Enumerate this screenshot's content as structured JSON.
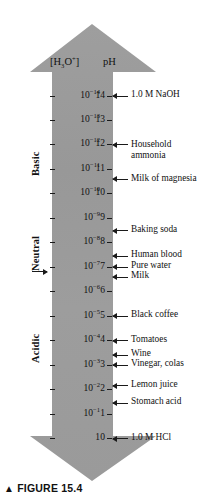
{
  "figure": {
    "caption_marker": "▲",
    "caption": "FIGURE 15.4",
    "arrow_color": "#9a9a9a",
    "text_color": "#111111"
  },
  "headers": {
    "concentration": "[H3O+]",
    "concentration_base": "[H",
    "concentration_sub": "3",
    "concentration_mid": "O",
    "concentration_sup": "+",
    "concentration_end": "]",
    "ph": "pH"
  },
  "regions": [
    {
      "label": "Basic",
      "top_ph": 14,
      "bottom_ph": 7.6
    },
    {
      "label": "Neutral",
      "top_ph": 7.6,
      "bottom_ph": 6.4
    },
    {
      "label": "Acidic",
      "top_ph": 6.4,
      "bottom_ph": 0
    }
  ],
  "neutral_pointer": {
    "target_ph": 7
  },
  "scale": {
    "ph_min": 0,
    "ph_max": 14,
    "rows": [
      {
        "ph": "14",
        "conc_mantissa": "10",
        "conc_exp": "−14"
      },
      {
        "ph": "13",
        "conc_mantissa": "10",
        "conc_exp": "−13"
      },
      {
        "ph": "12",
        "conc_mantissa": "10",
        "conc_exp": "−12"
      },
      {
        "ph": "11",
        "conc_mantissa": "10",
        "conc_exp": "−11"
      },
      {
        "ph": "10",
        "conc_mantissa": "10",
        "conc_exp": "−10"
      },
      {
        "ph": "9",
        "conc_mantissa": "10",
        "conc_exp": "−9"
      },
      {
        "ph": "8",
        "conc_mantissa": "10",
        "conc_exp": "−8"
      },
      {
        "ph": "7",
        "conc_mantissa": "10",
        "conc_exp": "−7"
      },
      {
        "ph": "6",
        "conc_mantissa": "10",
        "conc_exp": "−6"
      },
      {
        "ph": "5",
        "conc_mantissa": "10",
        "conc_exp": "−5"
      },
      {
        "ph": "4",
        "conc_mantissa": "10",
        "conc_exp": "−4"
      },
      {
        "ph": "3",
        "conc_mantissa": "10",
        "conc_exp": "−3"
      },
      {
        "ph": "2",
        "conc_mantissa": "10",
        "conc_exp": "−2"
      },
      {
        "ph": "1",
        "conc_mantissa": "10",
        "conc_exp": "−1"
      },
      {
        "ph": "0",
        "conc_mantissa": "1",
        "conc_exp": ""
      }
    ]
  },
  "callouts": [
    {
      "text": "1.0 M NaOH",
      "ph": 14.0,
      "lines": 1
    },
    {
      "text": "Household ammonia",
      "ph": 12.0,
      "lines": 2
    },
    {
      "text": "Milk of magnesia",
      "ph": 10.6,
      "lines": 2
    },
    {
      "text": "Baking soda",
      "ph": 8.5,
      "lines": 1
    },
    {
      "text": "Human blood",
      "ph": 7.45,
      "lines": 1
    },
    {
      "text": "Pure water",
      "ph": 7.0,
      "lines": 1
    },
    {
      "text": "Milk",
      "ph": 6.6,
      "lines": 1
    },
    {
      "text": "Black coffee",
      "ph": 5.0,
      "lines": 1
    },
    {
      "text": "Tomatoes",
      "ph": 4.0,
      "lines": 1
    },
    {
      "text": "Wine",
      "ph": 3.4,
      "lines": 1
    },
    {
      "text": "Vinegar, colas",
      "ph": 3.0,
      "lines": 1
    },
    {
      "text": "Lemon juice",
      "ph": 2.15,
      "lines": 1
    },
    {
      "text": "Stomach acid",
      "ph": 1.45,
      "lines": 1
    },
    {
      "text": "1.0 M HCl",
      "ph": 0.0,
      "lines": 1
    }
  ]
}
